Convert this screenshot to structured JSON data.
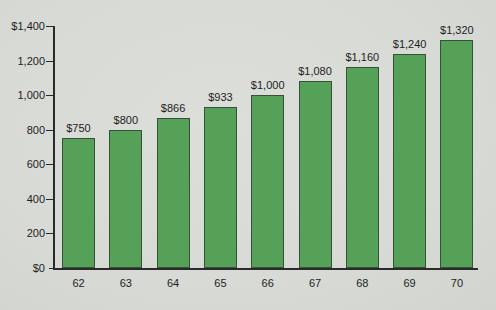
{
  "chart_data": {
    "type": "bar",
    "title": "",
    "xlabel": "",
    "ylabel": "",
    "categories": [
      "62",
      "63",
      "64",
      "65",
      "66",
      "67",
      "68",
      "69",
      "70"
    ],
    "values": [
      750,
      800,
      866,
      933,
      1000,
      1080,
      1160,
      1240,
      1320
    ],
    "value_labels": [
      "$750",
      "$800",
      "$866",
      "$933",
      "$1,000",
      "$1,080",
      "$1,160",
      "$1,240",
      "$1,320"
    ],
    "ylim": [
      0,
      1400
    ],
    "ytick_values": [
      1400,
      1200,
      1000,
      800,
      600,
      400,
      200,
      0
    ],
    "ytick_labels": [
      "$1,400",
      "1,200",
      "1,000",
      "800",
      "600",
      "400",
      "200",
      "$0"
    ],
    "grid": "off",
    "legend": "none",
    "bar_color": "#54a157",
    "bar_border_color": "#37503a",
    "background_color": "#dadcd8",
    "axis_color": "#2a2a2a",
    "text_color": "#1d1d1d"
  }
}
